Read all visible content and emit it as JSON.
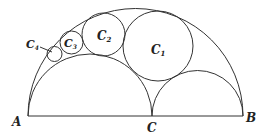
{
  "diagram": {
    "type": "arbelos with inscribed tangent circle chain",
    "stroke_color": "#333333",
    "points": {
      "A": {
        "label": "A",
        "x": 28,
        "y": 116
      },
      "C": {
        "label": "C",
        "x": 152,
        "y": 116
      },
      "B": {
        "label": "B",
        "x": 243,
        "y": 116
      }
    },
    "semicircles": [
      {
        "name": "big",
        "over": "AB",
        "cx": 135.5,
        "r": 107.5
      },
      {
        "name": "left",
        "over": "AC",
        "cx": 90,
        "r": 62
      },
      {
        "name": "right",
        "over": "CB",
        "cx": 197.5,
        "r": 45.5
      }
    ],
    "circles": [
      {
        "label": "C",
        "sub": "1",
        "cx": 158,
        "cy": 46,
        "r": 35
      },
      {
        "label": "C",
        "sub": "2",
        "cx": 103.5,
        "cy": 34.5,
        "r": 21.5
      },
      {
        "label": "C",
        "sub": "3",
        "cx": 71.5,
        "cy": 42.5,
        "r": 11.5
      },
      {
        "label": "C",
        "sub": "4",
        "cx": 54.5,
        "cy": 54,
        "r": 7.5
      }
    ],
    "labels": {
      "A": "A",
      "B": "B",
      "C": "C",
      "C1": "C",
      "C1_sub": "1",
      "C2": "C",
      "C2_sub": "2",
      "C3": "C",
      "C3_sub": "3",
      "C4": "C",
      "C4_sub": "4"
    }
  }
}
